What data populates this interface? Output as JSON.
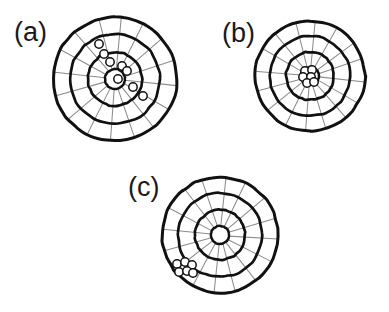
{
  "figure": {
    "background_color": "#ffffff",
    "width": 389,
    "height": 312,
    "ring_color": "#111111",
    "spoke_color": "#8c8c8c",
    "marker_edge_color": "#111111",
    "marker_fill": "none",
    "label_color": "#1a1a1a"
  },
  "chart_data": {
    "type": "scatter",
    "title": "",
    "xlabel": "",
    "ylabel": "",
    "coordinate_system": "polar",
    "grid": true,
    "legend": false,
    "panels": [
      {
        "id": "a",
        "label": "(a)",
        "label_x": 14,
        "label_y": 41,
        "center_x": 115,
        "center_y": 79,
        "outer_radius": 62,
        "ring_radii": [
          10,
          27,
          45,
          62
        ],
        "spoke_count": 16,
        "description": "scattered shots trailing from upper-left to lower-right",
        "points_xy": [
          [
            99,
            44
          ],
          [
            104,
            54
          ],
          [
            110,
            62
          ],
          [
            122,
            66
          ],
          [
            127,
            71
          ],
          [
            118,
            79
          ],
          [
            133,
            87
          ],
          [
            143,
            96
          ]
        ]
      },
      {
        "id": "b",
        "label": "(b)",
        "label_x": 222,
        "label_y": 42,
        "center_x": 310,
        "center_y": 76,
        "outer_radius": 55,
        "ring_radii": [
          9,
          24,
          40,
          55
        ],
        "spoke_count": 16,
        "description": "tight cluster of shots at the bullseye",
        "points_xy": [
          [
            305,
            71
          ],
          [
            312,
            70
          ],
          [
            303,
            77
          ],
          [
            311,
            77
          ],
          [
            307,
            83
          ],
          [
            314,
            82
          ]
        ]
      },
      {
        "id": "c",
        "label": "(c)",
        "label_x": 128,
        "label_y": 196,
        "center_x": 220,
        "center_y": 235,
        "outer_radius": 58,
        "ring_radii": [
          9,
          25,
          42,
          58
        ],
        "spoke_count": 16,
        "description": "tight cluster of shots offset to the lower-left, outside the middle ring",
        "points_xy": [
          [
            177,
            264
          ],
          [
            185,
            262
          ],
          [
            192,
            265
          ],
          [
            179,
            272
          ],
          [
            187,
            271
          ],
          [
            193,
            273
          ]
        ]
      }
    ],
    "marker_radius": 4.2,
    "marker_style": "open-circle"
  }
}
